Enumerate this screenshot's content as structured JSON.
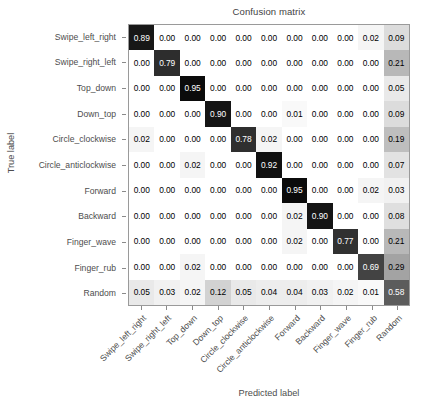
{
  "chart_data": {
    "type": "heatmap",
    "title": "Confusion matrix",
    "xlabel": "Predicted label",
    "ylabel": "True label",
    "normalized": true,
    "colormap": "Greys",
    "vmin": 0.0,
    "vmax": 1.0,
    "grid": false,
    "legend": "none",
    "categories": [
      "Swipe_left_right",
      "Swipe_right_left",
      "Top_down",
      "Down_top",
      "Circle_clockwise",
      "Circle_anticlockwise",
      "Forward",
      "Backward",
      "Finger_wave",
      "Finger_rub",
      "Random"
    ],
    "row_labels": [
      "Swipe_left_right",
      "Swipe_right_left",
      "Top_down",
      "Down_top",
      "Circle_clockwise",
      "Circle_anticlockwise",
      "Forward",
      "Backward",
      "Finger_wave",
      "Finger_rub",
      "Random"
    ],
    "col_labels": [
      "Swipe_left_right",
      "Swipe_right_left",
      "Top_down",
      "Down_top",
      "Circle_clockwise",
      "Circle_anticlockwise",
      "Forward",
      "Backward",
      "Finger_wave",
      "Finger_rub",
      "Random"
    ],
    "values": [
      [
        0.89,
        0.0,
        0.0,
        0.0,
        0.0,
        0.0,
        0.0,
        0.0,
        0.0,
        0.02,
        0.09
      ],
      [
        0.0,
        0.79,
        0.0,
        0.0,
        0.0,
        0.0,
        0.0,
        0.0,
        0.0,
        0.0,
        0.21
      ],
      [
        0.0,
        0.0,
        0.95,
        0.0,
        0.0,
        0.0,
        0.0,
        0.0,
        0.0,
        0.0,
        0.05
      ],
      [
        0.0,
        0.0,
        0.0,
        0.9,
        0.0,
        0.0,
        0.01,
        0.0,
        0.0,
        0.0,
        0.09
      ],
      [
        0.02,
        0.0,
        0.0,
        0.0,
        0.78,
        0.02,
        0.0,
        0.0,
        0.0,
        0.0,
        0.19
      ],
      [
        0.0,
        0.0,
        0.02,
        0.0,
        0.0,
        0.92,
        0.0,
        0.0,
        0.0,
        0.0,
        0.07
      ],
      [
        0.0,
        0.0,
        0.0,
        0.0,
        0.0,
        0.0,
        0.95,
        0.0,
        0.0,
        0.02,
        0.03
      ],
      [
        0.0,
        0.0,
        0.0,
        0.0,
        0.0,
        0.0,
        0.02,
        0.9,
        0.0,
        0.0,
        0.08
      ],
      [
        0.0,
        0.0,
        0.0,
        0.0,
        0.0,
        0.0,
        0.02,
        0.0,
        0.77,
        0.0,
        0.21
      ],
      [
        0.0,
        0.0,
        0.02,
        0.0,
        0.0,
        0.0,
        0.0,
        0.0,
        0.0,
        0.69,
        0.29
      ],
      [
        0.05,
        0.03,
        0.02,
        0.12,
        0.05,
        0.04,
        0.04,
        0.03,
        0.02,
        0.01,
        0.58
      ]
    ],
    "cell_text": [
      [
        "0.89",
        "0.00",
        "0.00",
        "0.00",
        "0.00",
        "0.00",
        "0.00",
        "0.00",
        "0.00",
        "0.02",
        "0.09"
      ],
      [
        "0.00",
        "0.79",
        "0.00",
        "0.00",
        "0.00",
        "0.00",
        "0.00",
        "0.00",
        "0.00",
        "0.00",
        "0.21"
      ],
      [
        "0.00",
        "0.00",
        "0.95",
        "0.00",
        "0.00",
        "0.00",
        "0.00",
        "0.00",
        "0.00",
        "0.00",
        "0.05"
      ],
      [
        "0.00",
        "0.00",
        "0.00",
        "0.90",
        "0.00",
        "0.00",
        "0.01",
        "0.00",
        "0.00",
        "0.00",
        "0.09"
      ],
      [
        "0.02",
        "0.00",
        "0.00",
        "0.00",
        "0.78",
        "0.02",
        "0.00",
        "0.00",
        "0.00",
        "0.00",
        "0.19"
      ],
      [
        "0.00",
        "0.00",
        "0.02",
        "0.00",
        "0.00",
        "0.92",
        "0.00",
        "0.00",
        "0.00",
        "0.00",
        "0.07"
      ],
      [
        "0.00",
        "0.00",
        "0.00",
        "0.00",
        "0.00",
        "0.00",
        "0.95",
        "0.00",
        "0.00",
        "0.02",
        "0.03"
      ],
      [
        "0.00",
        "0.00",
        "0.00",
        "0.00",
        "0.00",
        "0.00",
        "0.02",
        "0.90",
        "0.00",
        "0.00",
        "0.08"
      ],
      [
        "0.00",
        "0.00",
        "0.00",
        "0.00",
        "0.00",
        "0.00",
        "0.02",
        "0.00",
        "0.77",
        "0.00",
        "0.21"
      ],
      [
        "0.00",
        "0.00",
        "0.02",
        "0.00",
        "0.00",
        "0.00",
        "0.00",
        "0.00",
        "0.00",
        "0.69",
        "0.29"
      ],
      [
        "0.05",
        "0.03",
        "0.02",
        "0.12",
        "0.05",
        "0.04",
        "0.04",
        "0.03",
        "0.02",
        "0.01",
        "0.58"
      ]
    ]
  },
  "colors": {
    "axis_line": "#9a9a9a",
    "text": "#4d4d4d",
    "cell_text_light": "#ffffff",
    "cell_text_dark": "#000000",
    "background": "#ffffff"
  }
}
